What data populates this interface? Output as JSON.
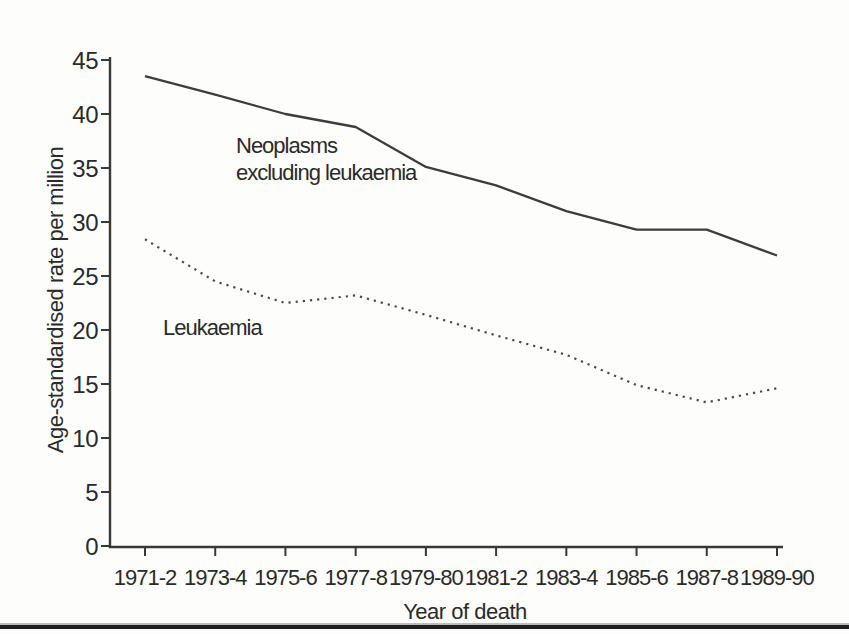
{
  "figure": {
    "y_axis_title": "Age-standardised rate per million",
    "x_axis_title": "Year of death",
    "annotations": {
      "neoplasms": "Neoplasms\nexcluding leukaemia",
      "leukaemia": "Leukaemia"
    }
  },
  "chart_data": {
    "type": "line",
    "title": "",
    "xlabel": "Year of death",
    "ylabel": "Age-standardised rate per million",
    "categories": [
      "1971-2",
      "1973-4",
      "1975-6",
      "1977-8",
      "1979-80",
      "1981-2",
      "1983-4",
      "1985-6",
      "1987-8",
      "1989-90"
    ],
    "series": [
      {
        "name": "Neoplasms excluding leukaemia",
        "style": "solid",
        "values": [
          43.5,
          41.8,
          40.0,
          38.8,
          35.1,
          33.4,
          31.0,
          29.3,
          29.3,
          26.9
        ]
      },
      {
        "name": "Leukaemia",
        "style": "dotted",
        "values": [
          28.4,
          24.5,
          22.5,
          23.2,
          21.4,
          19.5,
          17.7,
          14.9,
          13.3,
          14.6
        ]
      }
    ],
    "ylim": [
      0,
      45
    ],
    "yticks": [
      0,
      5,
      10,
      15,
      20,
      25,
      30,
      35,
      40,
      45
    ],
    "grid": false,
    "legend_position": "inline-annotations",
    "line_color": "#3d3d3d",
    "background_color": "#fdfdfc"
  }
}
